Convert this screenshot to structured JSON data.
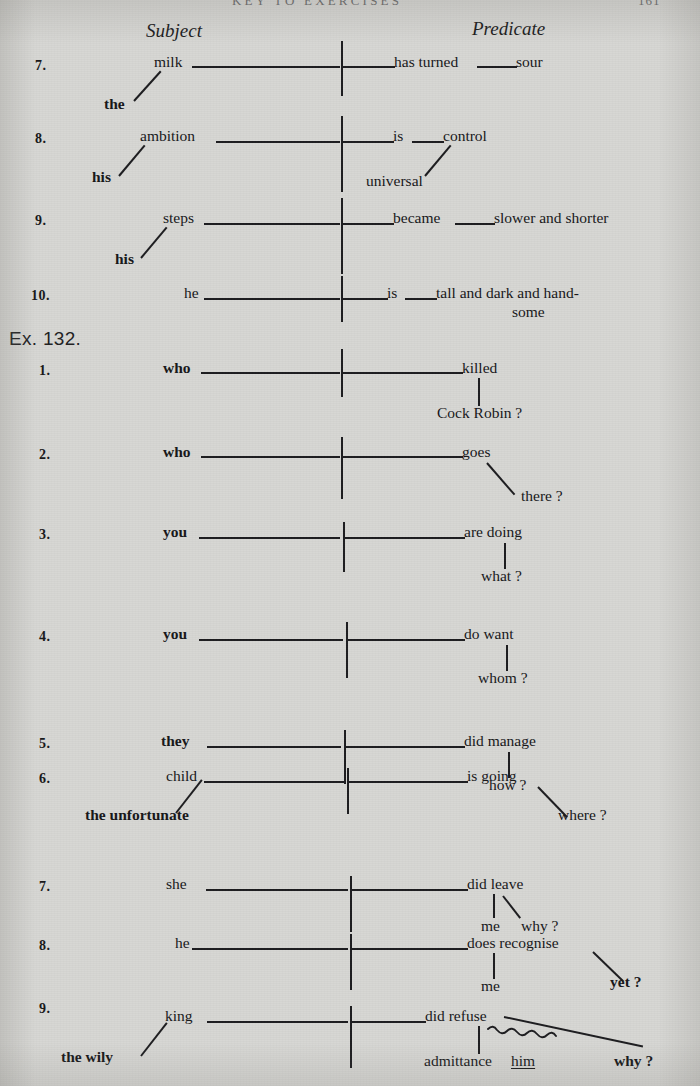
{
  "page": {
    "running_head": "KEY TO EXERCISES",
    "folio": "161",
    "width": 700,
    "height": 1086,
    "background_hex": "#d6d6d3",
    "ink_hex": "#17171a"
  },
  "columns": {
    "subject_label": "Subject",
    "predicate_label": "Predicate"
  },
  "exercise_heading": "Ex. 132.",
  "sentences_top": [
    {
      "number": "7.",
      "subject": "milk",
      "subject_modifier": "the",
      "verb": "has turned",
      "complement": "sour"
    },
    {
      "number": "8.",
      "subject": "ambition",
      "subject_modifier": "his",
      "verb": "is",
      "complement": "control",
      "complement_modifier": "universal"
    },
    {
      "number": "9.",
      "subject": "steps",
      "subject_modifier": "his",
      "verb": "became",
      "complement": "slower and shorter"
    },
    {
      "number": "10.",
      "subject": "he",
      "verb": "is",
      "complement_line1": "tall and dark and hand-",
      "complement_line2": "some"
    }
  ],
  "sentences_ex132": [
    {
      "number": "1.",
      "subject": "who",
      "verb": "killed",
      "object": "Cock Robin ?"
    },
    {
      "number": "2.",
      "subject": "who",
      "verb": "goes",
      "adverb": "there ?"
    },
    {
      "number": "3.",
      "subject": "you",
      "verb": "are doing",
      "object": "what ?"
    },
    {
      "number": "4.",
      "subject": "you",
      "verb": "do want",
      "object": "whom ?"
    },
    {
      "number": "5.",
      "subject": "they",
      "verb": "did manage",
      "adverb": "how ?"
    },
    {
      "number": "6.",
      "subject": "child",
      "subject_modifier": "the unfortunate",
      "verb": "is going",
      "adverb": "where ?"
    },
    {
      "number": "7.",
      "subject": "she",
      "verb": "did leave",
      "object": "me",
      "adverb": "why ?"
    },
    {
      "number": "8.",
      "subject": "he",
      "verb": "does recognise",
      "object": "me",
      "adverb": "yet ?"
    },
    {
      "number": "9.",
      "subject": "king",
      "subject_modifier": "the wily",
      "verb": "did refuse",
      "object": "admittance",
      "indirect_object": "him",
      "adverb": "why ?"
    }
  ]
}
